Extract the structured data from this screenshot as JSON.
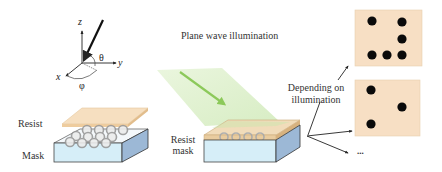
{
  "diagram": {
    "coordinate_system": {
      "axes": {
        "z": "z",
        "y": "y",
        "x": "x"
      },
      "angles": {
        "polar": "θ",
        "azimuthal": "φ"
      }
    },
    "left_stack": {
      "resist_label": "Resist",
      "mask_label": "Mask"
    },
    "center": {
      "illumination_label": "Plane wave illumination",
      "stack_label_line1": "Resist",
      "stack_label_line2": "mask"
    },
    "right": {
      "depending_line1": "Depending on",
      "depending_line2": "illumination",
      "ellipsis": "...",
      "patterns": [
        {
          "name": "pattern-1",
          "dots": 6
        },
        {
          "name": "pattern-2",
          "dots": 3
        }
      ]
    },
    "colors": {
      "resist": "#f6dfc0",
      "mask_front": "#d6eef8",
      "mask_side": "#9cb8d6",
      "beam": "#cfe9b4",
      "beam_arrow": "#8cc95a",
      "pattern_bg": "#f7dfc4",
      "dot": "#0a0a0a"
    }
  }
}
